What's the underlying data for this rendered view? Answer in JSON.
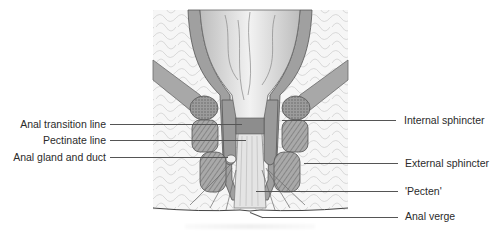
{
  "figure": {
    "labels_left": [
      {
        "text": "Anal transition line",
        "y": 124
      },
      {
        "text": "Pectinate line",
        "y": 140
      },
      {
        "text": "Anal gland and duct",
        "y": 157
      }
    ],
    "labels_right": [
      {
        "text": "Internal sphincter",
        "y": 120
      },
      {
        "text": "External sphincter",
        "y": 163
      },
      {
        "text": "'Pecten'",
        "y": 191
      },
      {
        "text": "Anal verge",
        "y": 216
      }
    ]
  },
  "colors": {
    "tissue_light": "#e6e6e6",
    "tissue_mid": "#b9b9b9",
    "tissue_dark": "#8a8a8a",
    "outline": "#555555",
    "background": "#ffffff"
  }
}
